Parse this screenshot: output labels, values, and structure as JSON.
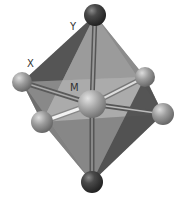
{
  "diagram": {
    "type": "octahedral-molecular-geometry",
    "labels": {
      "apical": "Y",
      "equatorial": "X",
      "center": "M"
    },
    "atoms": [
      {
        "id": "top",
        "role": "apical-ligand",
        "label": "Y"
      },
      {
        "id": "bottom",
        "role": "apical-ligand"
      },
      {
        "id": "left-back",
        "role": "equatorial-ligand",
        "label": "X"
      },
      {
        "id": "left-front",
        "role": "equatorial-ligand"
      },
      {
        "id": "right-back",
        "role": "equatorial-ligand"
      },
      {
        "id": "right-front",
        "role": "equatorial-ligand"
      },
      {
        "id": "center",
        "role": "central-atom",
        "label": "M"
      }
    ],
    "colors": {
      "apical_atom": "#3a3a3a",
      "equatorial_atom": "#9a9a9a",
      "center_atom": "#a8a8a8",
      "face_dark": "#5a5a5a",
      "face_mid": "#7d7d7d",
      "face_light": "#a5a5a5"
    }
  }
}
